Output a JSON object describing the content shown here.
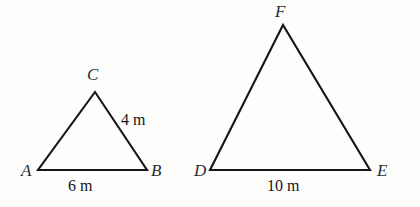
{
  "figure": {
    "type": "similar-triangles-diagram",
    "background_color": "#fdfdfc",
    "stroke_color": "#16161a",
    "label_color": "#2b2b30",
    "shapes": [
      {
        "id": "triangle-abc",
        "name": "triangle ABC",
        "vertices": [
          {
            "label": "A",
            "x": 38,
            "y": 170
          },
          {
            "label": "B",
            "x": 147,
            "y": 170
          },
          {
            "label": "C",
            "x": 95,
            "y": 92
          }
        ],
        "vertex_labels": [
          {
            "text": "A",
            "left": 21,
            "top": 162
          },
          {
            "text": "B",
            "left": 151,
            "top": 162
          },
          {
            "text": "C",
            "left": 87,
            "top": 66
          }
        ],
        "side_labels": [
          {
            "text": "4 m",
            "left": 121,
            "top": 112,
            "side": "CB"
          },
          {
            "text": "6 m",
            "left": 68,
            "top": 178,
            "side": "AB"
          }
        ]
      },
      {
        "id": "triangle-def",
        "name": "triangle DEF",
        "vertices": [
          {
            "label": "D",
            "x": 210,
            "y": 170
          },
          {
            "label": "E",
            "x": 370,
            "y": 170
          },
          {
            "label": "F",
            "x": 283,
            "y": 25
          }
        ],
        "vertex_labels": [
          {
            "text": "D",
            "left": 194,
            "top": 162
          },
          {
            "text": "E",
            "left": 377,
            "top": 162
          },
          {
            "text": "F",
            "left": 275,
            "top": 3
          }
        ],
        "side_labels": [
          {
            "text": "10 m",
            "left": 267,
            "top": 178,
            "side": "DE"
          }
        ]
      }
    ]
  },
  "bleed_through": {
    "note": "faint illegible show-through text from reverse side of scanned page",
    "fragments": [
      {
        "id": "a",
        "text": "              "
      },
      {
        "id": "b",
        "text": "          "
      },
      {
        "id": "c",
        "text": "      "
      },
      {
        "id": "d",
        "text": "         "
      },
      {
        "id": "e",
        "text": "        "
      },
      {
        "id": "f",
        "text": "      "
      }
    ]
  }
}
